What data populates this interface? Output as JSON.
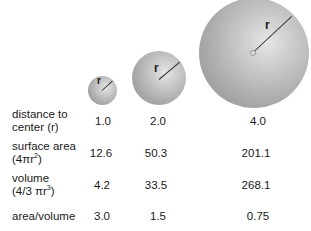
{
  "diagram": {
    "spheres": [
      {
        "name": "small-sphere",
        "r_label": "r",
        "radius_value": 1.0
      },
      {
        "name": "medium-sphere",
        "r_label": "r",
        "radius_value": 2.0
      },
      {
        "name": "large-sphere",
        "r_label": "r",
        "radius_value": 4.0
      }
    ],
    "rows": [
      {
        "label_line1": "distance to",
        "label_line2": "center (r)",
        "values": [
          "1.0",
          "2.0",
          "4.0"
        ]
      },
      {
        "label_line1": "surface area",
        "label_line2_pre": "(4πr",
        "label_line2_sup": "2",
        "label_line2_post": ")",
        "values": [
          "12.6",
          "50.3",
          "201.1"
        ]
      },
      {
        "label_line1": "volume",
        "label_line2_pre": "(4/3 πr",
        "label_line2_sup": "3",
        "label_line2_post": ")",
        "values": [
          "4.2",
          "33.5",
          "268.1"
        ]
      },
      {
        "label_line1": "area/volume",
        "values": [
          "3.0",
          "1.5",
          "0.75"
        ]
      }
    ]
  }
}
